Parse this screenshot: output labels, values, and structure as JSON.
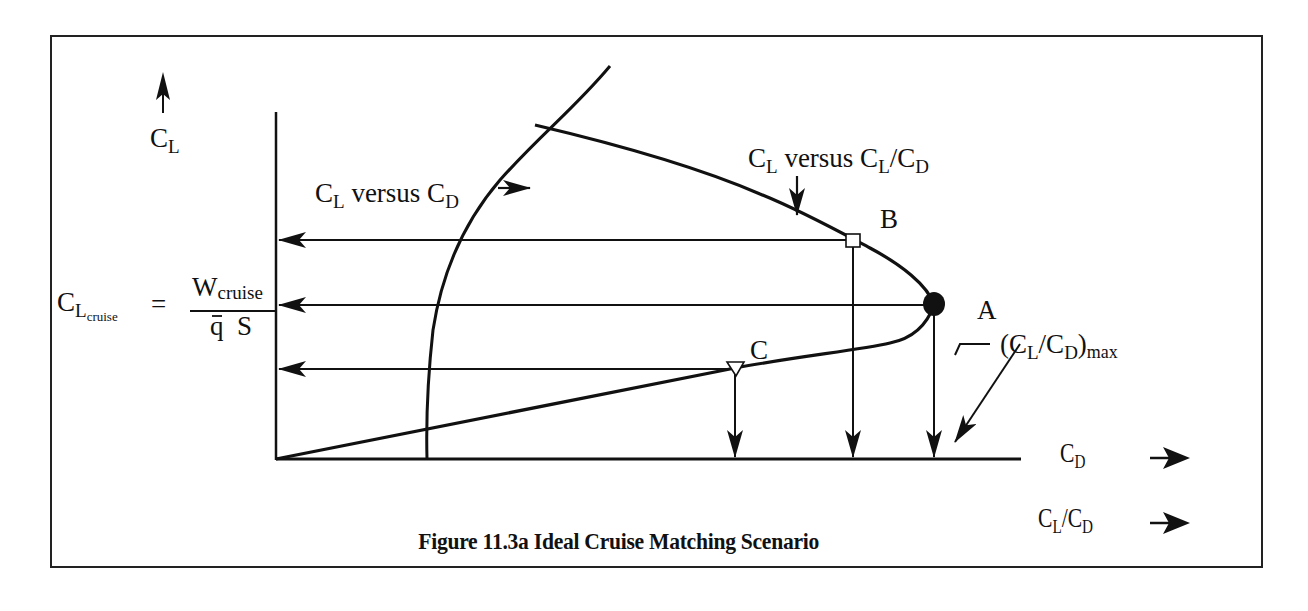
{
  "figure": {
    "caption": "Figure 11.3a Ideal Cruise Matching Scenario",
    "number": "11.3a",
    "title": "Ideal Cruise Matching Scenario"
  },
  "axes": {
    "y_axis_label_main": "C",
    "y_axis_label_sub": "L",
    "x_axis_1_label_main": "C",
    "x_axis_1_label_sub": "D",
    "x_axis_2_label_main": "C",
    "x_axis_2_label_sub1": "L",
    "x_axis_2_label_slash": "/C",
    "x_axis_2_label_sub2": "D"
  },
  "curves": {
    "drag_polar": {
      "label_main1": "C",
      "label_sub1": "L",
      "label_mid": " versus C",
      "label_sub2": "D"
    },
    "lift_to_drag": {
      "label_main1": "C",
      "label_sub1": "L",
      "label_mid": " versus C",
      "label_sub2": "L",
      "label_slash": "/C",
      "label_sub3": "D"
    }
  },
  "equation": {
    "lhs_main": "C",
    "lhs_sub": "L",
    "lhs_subsub": "cruise",
    "equals": "=",
    "numerator_main": "W",
    "numerator_sub": "cruise",
    "denominator": "q  S",
    "overbar_symbol": "q"
  },
  "points": {
    "A": {
      "label": "A",
      "marker": "filled-circle",
      "meaning": "(CL/CD)max"
    },
    "B": {
      "label": "B",
      "marker": "open-square"
    },
    "C": {
      "label": "C",
      "marker": "open-triangle-down"
    }
  },
  "annotation_max": {
    "open": "(C",
    "sub1": "L",
    "slash": "/C",
    "sub2": "D",
    "close": ")",
    "suffix": "max"
  },
  "colors": {
    "ink": "#111111",
    "background": "#ffffff",
    "frame": "#222222"
  }
}
